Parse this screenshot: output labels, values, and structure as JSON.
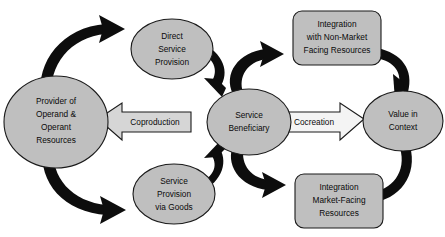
{
  "diagram": {
    "colors": {
      "node_fill": "#bfbfbf",
      "node_stroke": "#1a1a1a",
      "arrow_fill": "#0d0d0d",
      "band_fill_left": "#d6d6d6",
      "band_fill_right": "#f4f4f4",
      "background": "#ffffff",
      "text": "#0a0a0a"
    },
    "nodes": {
      "provider": {
        "shape": "ellipse",
        "lines": [
          "Provider of",
          "Operand &",
          "Operant",
          "Resources"
        ]
      },
      "direct_service_provision": {
        "shape": "ellipse",
        "lines": [
          "Direct",
          "Service",
          "Provision"
        ]
      },
      "service_provision_via_goods": {
        "shape": "ellipse",
        "lines": [
          "Service",
          "Provision",
          "via Goods"
        ]
      },
      "service_beneficiary": {
        "shape": "ellipse",
        "lines": [
          "Service",
          "Beneficiary"
        ]
      },
      "integration_non_market": {
        "shape": "rounded-rect",
        "lines": [
          "Integration",
          "with Non-Market",
          "Facing Resources"
        ]
      },
      "integration_market_facing": {
        "shape": "rounded-rect",
        "lines": [
          "Integration",
          "Market-Facing",
          "Resources"
        ]
      },
      "value_in_context": {
        "shape": "ellipse",
        "lines": [
          "Value in",
          "Context"
        ]
      }
    },
    "band_arrows": {
      "coproduction": {
        "label": "Coproduction",
        "direction": "left"
      },
      "cocreation": {
        "label": "Cocreation",
        "direction": "right"
      }
    },
    "flow_arrows": [
      {
        "name": "provider-to-direct-service-provision",
        "from": "provider",
        "to": "direct_service_provision"
      },
      {
        "name": "direct-service-provision-to-service-beneficiary",
        "from": "direct_service_provision",
        "to": "service_beneficiary"
      },
      {
        "name": "service-beneficiary-to-integration-non-market",
        "from": "service_beneficiary",
        "to": "integration_non_market"
      },
      {
        "name": "integration-non-market-to-value-in-context",
        "from": "integration_non_market",
        "to": "value_in_context"
      },
      {
        "name": "provider-to-service-provision-via-goods",
        "from": "provider",
        "to": "service_provision_via_goods"
      },
      {
        "name": "service-provision-via-goods-to-service-beneficiary",
        "from": "service_provision_via_goods",
        "to": "service_beneficiary"
      },
      {
        "name": "service-beneficiary-to-integration-market-facing",
        "from": "service_beneficiary",
        "to": "integration_market_facing"
      },
      {
        "name": "value-in-context-to-integration-market-facing",
        "from": "value_in_context",
        "to": "integration_market_facing"
      }
    ]
  }
}
